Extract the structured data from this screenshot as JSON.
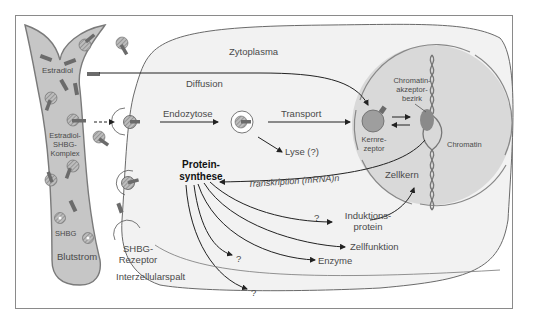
{
  "labels": {
    "zytoplasma": "Zytoplasma",
    "estradiol": "Estradiol",
    "diffusion": "Diffusion",
    "endozytose": "Endozytose",
    "transport": "Transport",
    "estradiol_shbg_1": "Estradiol-",
    "estradiol_shbg_2": "SHBG-",
    "estradiol_shbg_3": "Komplex",
    "lyse": "Lyse (?)",
    "kernrezeptor_1": "Kernre-",
    "kernrezeptor_2": "zeptor",
    "chromatin_akzeptor_1": "Chromatin-",
    "chromatin_akzeptor_2": "akzeptor-",
    "chromatin_akzeptor_3": "bezirk",
    "chromatin": "Chromatin",
    "zellkern": "Zellkern",
    "proteinsynthese_1": "Protein-",
    "proteinsynthese_2": "synthese",
    "transkription": "Transkription (mRNA)n",
    "question_1": "?",
    "induktionsprotein_1": "Induktions-",
    "induktionsprotein_2": "protein",
    "zellfunktion": "Zellfunktion",
    "enzyme": "Enzyme",
    "question_2": "?",
    "question_3": "?",
    "shbg": "SHBG",
    "blutstrom": "Blutstrom",
    "shbg_rezeptor_1": "SHBG-",
    "shbg_rezeptor_2": "Rezeptor",
    "interzellularspalt": "Interzellularspalt"
  },
  "colors": {
    "blood": "#c8c8c8",
    "blood_border": "#7a7a7a",
    "cytoplasm": "#f2f2f2",
    "nucleus": "#d8d8d8",
    "steroid": "#6b6b6b",
    "line": "#222222"
  }
}
